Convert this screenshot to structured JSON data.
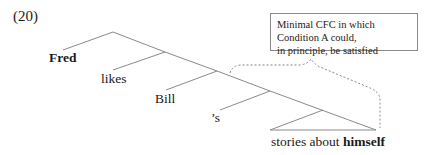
{
  "example_number": "(20)",
  "tree": {
    "leaves": [
      {
        "text": "Fred",
        "bold": true
      },
      {
        "text": "likes",
        "bold": false
      },
      {
        "text": "Bill",
        "bold": false
      },
      {
        "text": "’s",
        "bold": false
      }
    ],
    "triangle_leaf": {
      "prefix": "stories about ",
      "bold_word": "himself"
    }
  },
  "annotation": {
    "line1": "Minimal CFC in which Condition A could,",
    "line2": "in principle, be satisfied"
  },
  "colors": {
    "tree_lines": "#8a8a8a",
    "dotted_bracket": "#8a8a8a",
    "box_border": "#8a8a8a",
    "text": "#1a1a1a"
  }
}
